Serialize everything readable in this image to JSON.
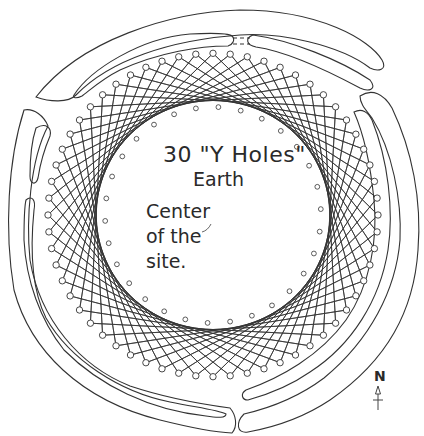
{
  "labels": {
    "title_line1": "30 \"Y Holes\"",
    "title_line2": "Earth",
    "center_line1": "Center",
    "center_line2": "of the",
    "center_line3": "site.",
    "north": "N"
  },
  "geometry": {
    "center": [
      213,
      215
    ],
    "outer_hole_count": 60,
    "outer_hole_radius": 165,
    "envelope_radius": 100,
    "connect_step": 15,
    "inner_hole_count": 30,
    "inner_hole_radius": 108,
    "stroke_color": "#333333",
    "background": "#ffffff"
  }
}
